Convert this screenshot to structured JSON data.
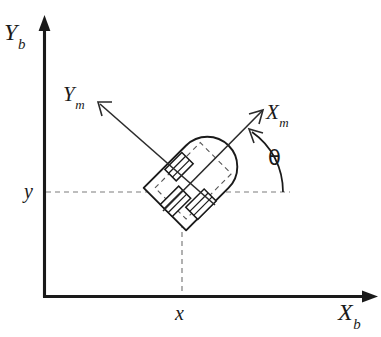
{
  "figure": {
    "background_color": "#ffffff",
    "stroke_color": "#1a1a1a",
    "dash_color": "#7d7d7d",
    "width": 381,
    "height": 337
  },
  "axes": {
    "y_axis": {
      "name": "Y_b",
      "label_main": "Y",
      "label_sub": "b",
      "orientation": "vertical",
      "arrow_direction": "up"
    },
    "x_axis": {
      "name": "X_b",
      "label_main": "X",
      "label_sub": "b",
      "orientation": "horizontal",
      "arrow_direction": "right"
    },
    "origin_label": ""
  },
  "body_frame": {
    "x_axis": {
      "name": "X_m",
      "label_main": "X",
      "label_sub": "m",
      "arrow_direction": "up-right"
    },
    "y_axis": {
      "name": "Y_m",
      "label_main": "Y",
      "label_sub": "m",
      "arrow_direction": "up-left"
    }
  },
  "coordinates": {
    "x_tick_label": "x",
    "y_tick_label": "y"
  },
  "angle": {
    "symbol": "θ",
    "description": "heading angle between X_b and X_m"
  },
  "robot": {
    "shape": "bullet",
    "heading_deg": 45,
    "wheels": 3
  }
}
